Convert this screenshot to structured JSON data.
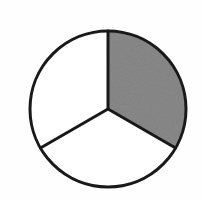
{
  "figure": {
    "title": "Circle divided into three equal sectors",
    "background_color": "#fefefe",
    "outline_color": "#191919",
    "shaded_color": "#8a8a8a",
    "unshaded_color": "#ffffff",
    "width": 202,
    "height": 200
  },
  "geometry": {
    "center_x": 108,
    "center_y": 109,
    "radius": 78,
    "stroke_width": 3,
    "divider_angles_deg": [
      90,
      210,
      330
    ]
  },
  "chart_data": {
    "type": "pie",
    "title": "Circle divided into three equal sectors",
    "categories": [
      "Shaded sector",
      "Unshaded sector (lower)",
      "Unshaded sector (left)"
    ],
    "values": [
      33.3,
      33.3,
      33.3
    ],
    "labels": [
      "",
      "",
      ""
    ],
    "colors": [
      "#8a8a8a",
      "#ffffff",
      "#ffffff"
    ],
    "start_angle_deg": 90,
    "direction": "clockwise",
    "legend": false,
    "grid": false,
    "xlabel": "",
    "ylabel": ""
  },
  "sectors": [
    {
      "name": "shaded-sector",
      "fill": "#8a8a8a",
      "start_angle_deg": 90,
      "end_angle_deg": 330,
      "fraction_label": "1/3"
    },
    {
      "name": "unshaded-sector-lower",
      "fill": "#ffffff",
      "start_angle_deg": 330,
      "end_angle_deg": 210,
      "fraction_label": "1/3"
    },
    {
      "name": "unshaded-sector-left",
      "fill": "#ffffff",
      "start_angle_deg": 210,
      "end_angle_deg": 90,
      "fraction_label": "1/3"
    }
  ]
}
